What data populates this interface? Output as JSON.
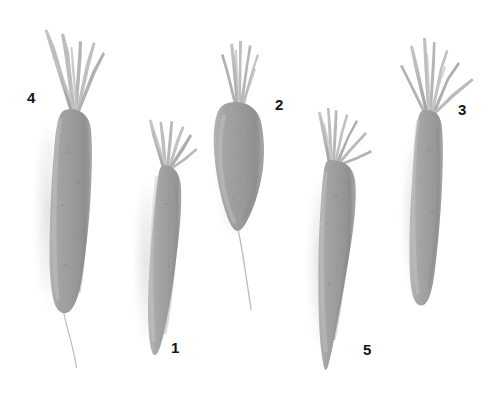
{
  "figure": {
    "background_color": "#ffffff",
    "width": 499,
    "height": 403,
    "image_mode": "grayscale",
    "label_color": "#151515",
    "root_body_color": "#9b9b9b",
    "root_body_light_color": "#b4b4b4",
    "root_body_dark_color": "#8a8a8a",
    "stem_color": "#b9b9b9",
    "stem_dark_color": "#9e9e9e",
    "shadow_color": "#e3e3e3",
    "tail_color": "#bdbdbd"
  },
  "specimens": [
    {
      "label": "4",
      "label_x": 27,
      "label_y": 90,
      "description": "long cylindrical blunt root with tall splayed cut petioles and fine root tail",
      "tip_type": "blunt-rounded",
      "has_root_tail": true
    },
    {
      "label": "1",
      "label_x": 171,
      "label_y": 340,
      "description": "medium tapered root with short cut petioles, pointed tip",
      "tip_type": "tapered-point",
      "has_root_tail": false
    },
    {
      "label": "2",
      "label_x": 275,
      "label_y": 97,
      "description": "short conical stubby root with dense short petioles and long wiry root tail",
      "tip_type": "abrupt-conical",
      "has_root_tail": true
    },
    {
      "label": "3",
      "label_x": 458,
      "label_y": 102,
      "description": "slender cylindrical root with long splayed petioles, blunt rounded tip",
      "tip_type": "blunt-rounded",
      "has_root_tail": false
    },
    {
      "label": "5",
      "label_x": 363,
      "label_y": 342,
      "description": "broad-shouldered strongly tapering conical root with petioles swept to the right",
      "tip_type": "sharp-point",
      "has_root_tail": false
    }
  ]
}
